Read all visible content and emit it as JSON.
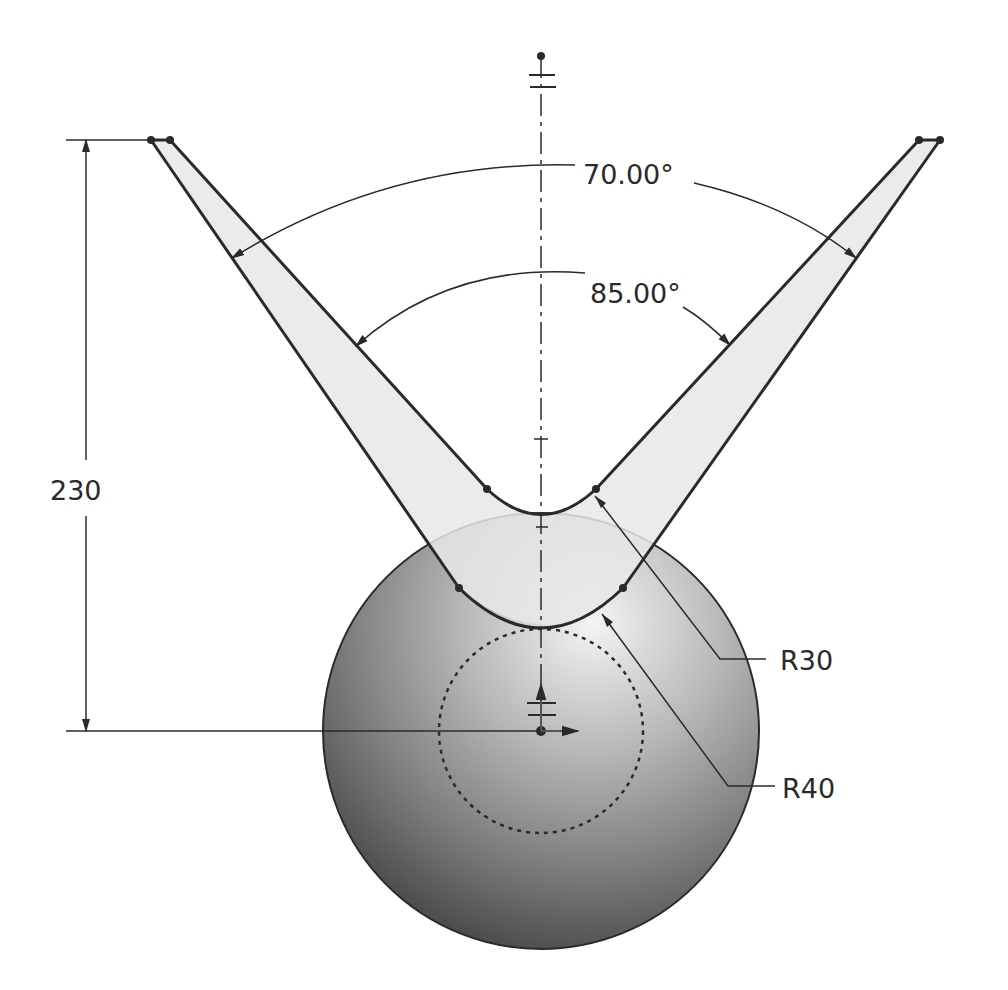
{
  "drawing": {
    "type": "CAD sketch",
    "dimensions": {
      "angle_outer": "70.00°",
      "angle_inner": "85.00°",
      "height": "230",
      "radius_inner": "R30",
      "radius_outer": "R40"
    },
    "colors": {
      "line": "#2a2a2a",
      "arm_fill": "#e6e6e6",
      "sphere_light": "#f2f2f2",
      "sphere_dark": "#3a3a3a",
      "background": "#ffffff"
    }
  }
}
